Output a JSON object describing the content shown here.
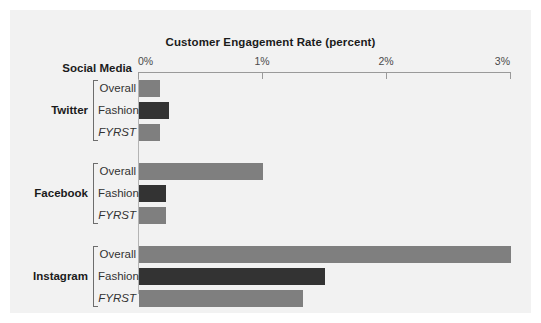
{
  "chart_data": {
    "type": "bar",
    "orientation": "horizontal",
    "title": "Customer Engagement Rate (percent)",
    "xlabel": "",
    "ylabel": "Social Media",
    "xlim": [
      0,
      3
    ],
    "xticks": [
      0,
      1,
      2,
      3
    ],
    "xtick_labels": [
      "0%",
      "1%",
      "2%",
      "3%"
    ],
    "grid": false,
    "legend": "none",
    "groups": [
      {
        "name": "Twitter",
        "rows": [
          {
            "label": "Overall",
            "value": 0.17,
            "style": "normal",
            "color": "#7f7f7f"
          },
          {
            "label": "Fashion",
            "value": 0.24,
            "style": "normal",
            "color": "#333333"
          },
          {
            "label": "FYRST",
            "value": 0.17,
            "style": "italic",
            "color": "#7f7f7f"
          }
        ]
      },
      {
        "name": "Facebook",
        "rows": [
          {
            "label": "Overall",
            "value": 1.0,
            "style": "normal",
            "color": "#7f7f7f"
          },
          {
            "label": "Fashion",
            "value": 0.22,
            "style": "normal",
            "color": "#333333"
          },
          {
            "label": "FYRST",
            "value": 0.22,
            "style": "italic",
            "color": "#7f7f7f"
          }
        ]
      },
      {
        "name": "Instagram",
        "rows": [
          {
            "label": "Overall",
            "value": 3.0,
            "style": "normal",
            "color": "#7f7f7f"
          },
          {
            "label": "Fashion",
            "value": 1.5,
            "style": "normal",
            "color": "#333333"
          },
          {
            "label": "FYRST",
            "value": 1.32,
            "style": "italic",
            "color": "#7f7f7f"
          }
        ]
      }
    ],
    "colors": {
      "bar_gray": "#7f7f7f",
      "bar_dark": "#333333",
      "background": "#f2f2f2",
      "axis": "#9a9a9a",
      "text": "#1b1b1b"
    }
  }
}
